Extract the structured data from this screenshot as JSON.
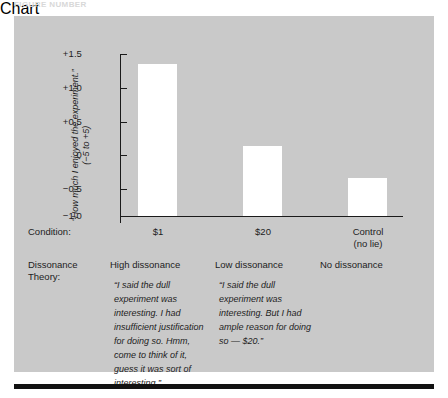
{
  "figure": {
    "top_caption": "FIGURE NUMBER",
    "panel_color": "#c9c9c9",
    "bar_color": "#ffffff",
    "axis_color": "#1a1a1a",
    "rule_color": "#121212"
  },
  "axis": {
    "y_title_line1": "“How much I enjoyed the experiment.”",
    "y_title_line2": "(−5 to +5)",
    "ticks": [
      {
        "label": "+1.5",
        "value": 1.5
      },
      {
        "label": "+1.0",
        "value": 1.0
      },
      {
        "label": "+0.5",
        "value": 0.5
      },
      {
        "label": "0",
        "value": 0
      },
      {
        "label": "−0.5",
        "value": -0.5
      },
      {
        "label": "−1.0",
        "value": -1.0
      }
    ]
  },
  "rows": {
    "condition_label": "Condition:",
    "theory_label_line1": "Dissonance",
    "theory_label_line2": "Theory:"
  },
  "chart_data": {
    "type": "bar",
    "title": "",
    "xlabel": "Condition",
    "ylabel": "“How much I enjoyed the experiment.” (−5 to +5)",
    "ylim": [
      -1.0,
      1.5
    ],
    "yticks": [
      -1.0,
      -0.5,
      0,
      0.5,
      1.0,
      1.5
    ],
    "grid": false,
    "legend": "none",
    "baseline": -1.0,
    "categories": [
      "$1",
      "$20",
      "Control\n(no lie)"
    ],
    "values": [
      1.35,
      0.08,
      -0.42
    ],
    "series": [
      {
        "name": "Mean enjoyment rating",
        "values": [
          1.35,
          0.08,
          -0.42
        ]
      }
    ]
  },
  "columns": [
    {
      "condition_line1": "$1",
      "condition_line2": "",
      "theory": "High dissonance",
      "quote": "“I said the dull experiment was interesting.  I had insufficient justification for doing so.  Hmm, come to think of it, guess it was sort of interesting.”"
    },
    {
      "condition_line1": "$20",
      "condition_line2": "",
      "theory": "Low dissonance",
      "quote": "“I said the dull experiment was interesting.  But I had ample reason for doing so — $20.”"
    },
    {
      "condition_line1": "Control",
      "condition_line2": "(no lie)",
      "theory": "No dissonance",
      "quote": ""
    }
  ]
}
